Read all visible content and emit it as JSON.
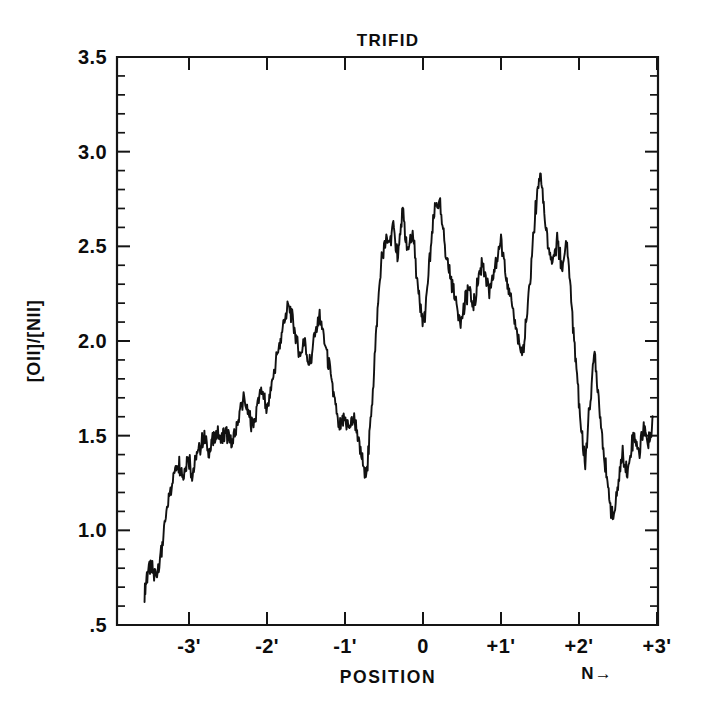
{
  "figure": {
    "title": "TRIFID",
    "background_color": "#ffffff",
    "ink_color": "#111111"
  },
  "chart_data": {
    "type": "line",
    "title": "TRIFID",
    "xlabel": "POSITION",
    "ylabel": "[O II]/[N II]",
    "ylabel_display": "[OII]/[NII]",
    "xlim": [
      -3.6,
      3.0
    ],
    "ylim": [
      0.5,
      3.5
    ],
    "grid": false,
    "legend": null,
    "annotations": [
      {
        "text": "N→",
        "x": 2.55,
        "y": 0.37,
        "meaning": "north-direction-arrow"
      }
    ],
    "x_ticks": [
      -3,
      -2,
      -1,
      0,
      1,
      2,
      3
    ],
    "x_tick_labels": [
      "-3'",
      "-2'",
      "-1'",
      "0",
      "+1'",
      "+2'",
      "+3'"
    ],
    "x_minor_step": 0.2,
    "y_ticks": [
      0.5,
      1.0,
      1.5,
      2.0,
      2.5,
      3.0,
      3.5
    ],
    "y_tick_labels": [
      ".5",
      "1.0",
      "1.5",
      "2.0",
      "2.5",
      "3.0",
      "3.5"
    ],
    "y_minor_step": 0.1,
    "series": [
      {
        "name": "[OII]/[NII] ratio along slit",
        "color": "#111111",
        "x": [
          -3.57,
          -3.55,
          -3.53,
          -3.5,
          -3.47,
          -3.44,
          -3.41,
          -3.38,
          -3.35,
          -3.32,
          -3.29,
          -3.26,
          -3.23,
          -3.2,
          -3.17,
          -3.14,
          -3.11,
          -3.08,
          -3.05,
          -3.02,
          -2.99,
          -2.96,
          -2.93,
          -2.9,
          -2.87,
          -2.84,
          -2.81,
          -2.78,
          -2.75,
          -2.72,
          -2.69,
          -2.66,
          -2.63,
          -2.6,
          -2.57,
          -2.54,
          -2.51,
          -2.48,
          -2.45,
          -2.42,
          -2.39,
          -2.36,
          -2.33,
          -2.3,
          -2.27,
          -2.24,
          -2.21,
          -2.18,
          -2.15,
          -2.12,
          -2.09,
          -2.06,
          -2.03,
          -2.0,
          -1.97,
          -1.94,
          -1.91,
          -1.88,
          -1.85,
          -1.82,
          -1.79,
          -1.76,
          -1.73,
          -1.7,
          -1.67,
          -1.64,
          -1.61,
          -1.58,
          -1.55,
          -1.52,
          -1.49,
          -1.46,
          -1.43,
          -1.4,
          -1.37,
          -1.34,
          -1.31,
          -1.28,
          -1.25,
          -1.22,
          -1.19,
          -1.16,
          -1.13,
          -1.1,
          -1.07,
          -1.04,
          -1.01,
          -0.98,
          -0.95,
          -0.92,
          -0.89,
          -0.86,
          -0.83,
          -0.8,
          -0.77,
          -0.74,
          -0.71,
          -0.68,
          -0.65,
          -0.62,
          -0.59,
          -0.56,
          -0.53,
          -0.5,
          -0.47,
          -0.44,
          -0.41,
          -0.38,
          -0.35,
          -0.32,
          -0.29,
          -0.26,
          -0.23,
          -0.2,
          -0.17,
          -0.14,
          -0.11,
          -0.08,
          -0.05,
          -0.02,
          0.01,
          0.04,
          0.07,
          0.1,
          0.13,
          0.16,
          0.19,
          0.22,
          0.25,
          0.28,
          0.31,
          0.34,
          0.37,
          0.4,
          0.43,
          0.46,
          0.49,
          0.52,
          0.55,
          0.58,
          0.61,
          0.64,
          0.67,
          0.7,
          0.73,
          0.76,
          0.79,
          0.82,
          0.85,
          0.88,
          0.91,
          0.94,
          0.97,
          1.0,
          1.03,
          1.06,
          1.09,
          1.12,
          1.15,
          1.18,
          1.21,
          1.24,
          1.27,
          1.3,
          1.33,
          1.36,
          1.39,
          1.42,
          1.45,
          1.48,
          1.51,
          1.54,
          1.57,
          1.6,
          1.63,
          1.66,
          1.69,
          1.72,
          1.75,
          1.78,
          1.81,
          1.84,
          1.87,
          1.9,
          1.93,
          1.96,
          1.99,
          2.02,
          2.05,
          2.08,
          2.11,
          2.14,
          2.17,
          2.2,
          2.23,
          2.26,
          2.29,
          2.32,
          2.35,
          2.38,
          2.41,
          2.44,
          2.47,
          2.5,
          2.53,
          2.56,
          2.59,
          2.62,
          2.65
        ],
        "y": [
          0.66,
          0.72,
          0.78,
          0.81,
          0.79,
          0.76,
          0.79,
          0.84,
          0.9,
          0.99,
          1.08,
          1.16,
          1.23,
          1.28,
          1.32,
          1.36,
          1.33,
          1.28,
          1.33,
          1.39,
          1.36,
          1.3,
          1.35,
          1.4,
          1.43,
          1.46,
          1.49,
          1.46,
          1.42,
          1.45,
          1.49,
          1.52,
          1.5,
          1.47,
          1.49,
          1.52,
          1.5,
          1.47,
          1.45,
          1.48,
          1.54,
          1.6,
          1.66,
          1.7,
          1.66,
          1.62,
          1.58,
          1.56,
          1.6,
          1.68,
          1.74,
          1.72,
          1.68,
          1.64,
          1.69,
          1.76,
          1.83,
          1.9,
          1.96,
          2.02,
          2.08,
          2.14,
          2.17,
          2.15,
          2.11,
          2.05,
          1.98,
          1.92,
          1.96,
          2.01,
          1.94,
          1.87,
          1.92,
          1.99,
          2.06,
          2.13,
          2.1,
          2.04,
          1.97,
          1.9,
          1.83,
          1.76,
          1.68,
          1.6,
          1.53,
          1.57,
          1.6,
          1.57,
          1.53,
          1.56,
          1.58,
          1.54,
          1.48,
          1.41,
          1.34,
          1.28,
          1.36,
          1.52,
          1.7,
          1.9,
          2.1,
          2.28,
          2.42,
          2.5,
          2.54,
          2.52,
          2.56,
          2.62,
          2.52,
          2.44,
          2.58,
          2.68,
          2.56,
          2.46,
          2.52,
          2.58,
          2.48,
          2.35,
          2.22,
          2.12,
          2.1,
          2.18,
          2.34,
          2.5,
          2.62,
          2.7,
          2.74,
          2.7,
          2.6,
          2.5,
          2.42,
          2.36,
          2.3,
          2.24,
          2.19,
          2.15,
          2.12,
          2.16,
          2.22,
          2.28,
          2.24,
          2.18,
          2.22,
          2.3,
          2.38,
          2.42,
          2.38,
          2.3,
          2.24,
          2.28,
          2.35,
          2.42,
          2.48,
          2.52,
          2.46,
          2.38,
          2.3,
          2.22,
          2.16,
          2.1,
          2.04,
          1.98,
          1.92,
          2.0,
          2.12,
          2.26,
          2.42,
          2.58,
          2.72,
          2.84,
          2.87,
          2.76,
          2.62,
          2.52,
          2.44,
          2.4,
          2.46,
          2.52,
          2.46,
          2.38,
          2.44,
          2.52,
          2.4,
          2.22,
          2.04,
          1.88,
          1.72,
          1.58,
          1.45,
          1.35,
          1.52,
          1.68,
          1.82,
          1.94,
          1.8,
          1.66,
          1.52,
          1.4,
          1.3,
          1.2,
          1.12,
          1.06,
          1.14,
          1.24,
          1.34,
          1.42,
          1.36,
          1.3,
          1.38
        ]
      }
    ],
    "data_note": "Single trace; high-frequency scatter preserved in the traced sample set",
    "series_tail": {
      "name": "continuation",
      "x": [
        2.68,
        2.71,
        2.74,
        2.77,
        2.8,
        2.83,
        2.86,
        2.89,
        2.92,
        2.95
      ],
      "y": [
        1.46,
        1.52,
        1.46,
        1.4,
        1.48,
        1.56,
        1.5,
        1.44,
        1.52,
        1.6
      ]
    }
  },
  "axes": {
    "title": "TRIFID",
    "x_axis_title": "POSITION",
    "y_axis_title": "[OII]/[NII]",
    "north_arrow_label": "N→",
    "x_tick_labels": [
      "-3'",
      "-2'",
      "-1'",
      "0",
      "+1'",
      "+2'",
      "+3'"
    ],
    "y_tick_labels": [
      "3.5",
      "3.0",
      "2.5",
      "2.0",
      "1.5",
      "1.0",
      ".5"
    ]
  }
}
